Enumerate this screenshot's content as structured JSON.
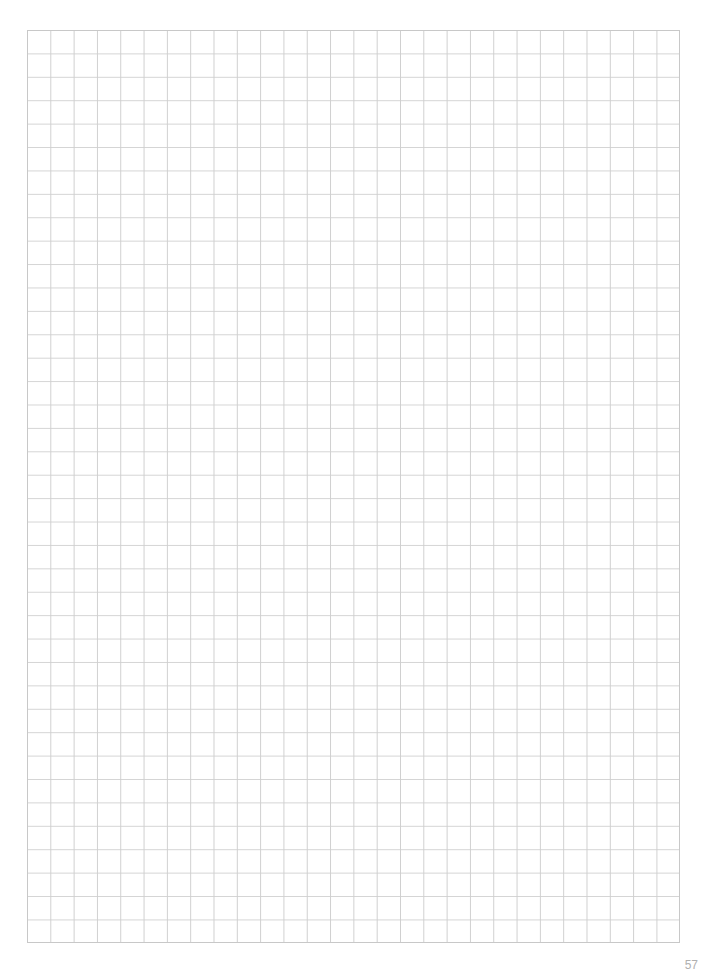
{
  "page": {
    "type": "graph-paper",
    "grid": {
      "columns": 28,
      "rows": 39,
      "line_color": "#cfcfcf",
      "background": "#ffffff"
    },
    "page_number": "57"
  }
}
